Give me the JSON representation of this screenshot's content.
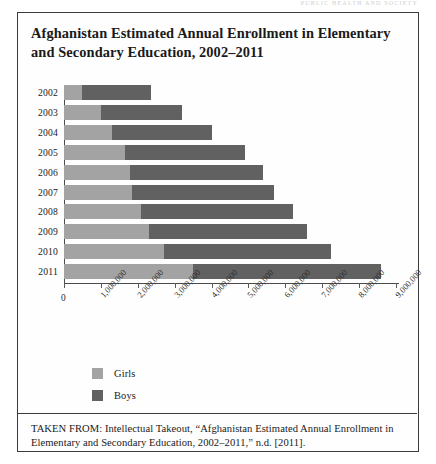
{
  "page": {
    "running_head": "PUBLIC HEALTH AND SOCIETY"
  },
  "figure": {
    "title": "Afghanistan Estimated Annual Enrollment in Elementary and Secondary Education, 2002–2011",
    "source_note": "TAKEN FROM:  Intellectual Takeout, “Afghanistan Estimated Annual Enrollment in Elementary and Secondary Education, 2002–2011,” n.d. [2011]."
  },
  "legend": {
    "items": [
      {
        "label": "Girls",
        "color": "#a3a3a3",
        "swatch_name": "legend-swatch-girls"
      },
      {
        "label": "Boys",
        "color": "#616161",
        "swatch_name": "legend-swatch-boys"
      }
    ]
  },
  "chart_data": {
    "type": "bar",
    "orientation": "horizontal",
    "stacked": true,
    "title": "Afghanistan Estimated Annual Enrollment in Elementary and Secondary Education, 2002–2011",
    "xlabel": "",
    "ylabel": "",
    "categories": [
      "2002",
      "2003",
      "2004",
      "2005",
      "2006",
      "2007",
      "2008",
      "2009",
      "2010",
      "2011"
    ],
    "series": [
      {
        "name": "Girls",
        "color": "#a3a3a3",
        "values": [
          500000,
          1000000,
          1300000,
          1650000,
          1800000,
          1850000,
          2100000,
          2300000,
          2700000,
          3500000
        ]
      },
      {
        "name": "Boys",
        "color": "#616161",
        "values": [
          1850000,
          2200000,
          2700000,
          3250000,
          3600000,
          3850000,
          4100000,
          4300000,
          4550000,
          5100000
        ]
      }
    ],
    "totals": [
      2350000,
      3200000,
      4000000,
      4900000,
      5400000,
      5700000,
      6200000,
      6600000,
      7250000,
      8600000
    ],
    "xlim": [
      0,
      9000000
    ],
    "xticks": [
      0,
      1000000,
      2000000,
      3000000,
      4000000,
      5000000,
      6000000,
      7000000,
      8000000,
      9000000
    ],
    "xtick_labels": [
      "0",
      "1,000,000",
      "2,000,000",
      "3,000,000",
      "4,000,000",
      "5,000,000",
      "6,000,000",
      "7,000,000",
      "8,000,000",
      "9,000,000"
    ],
    "grid": false,
    "legend_position": "below-left"
  }
}
